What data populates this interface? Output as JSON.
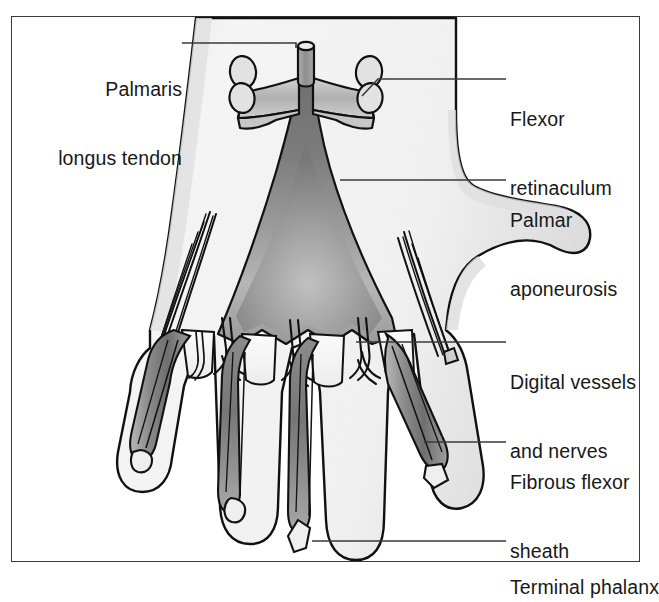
{
  "figure": {
    "frame_border_color": "#3a3a3a",
    "background_color": "#ffffff"
  },
  "palette": {
    "outline": "#111111",
    "leader_line": "#3a3a3a",
    "text": "#181818",
    "skin_light": "#f2f2f2",
    "skin_shade": "#d8d8d8",
    "aponeurosis_mid": "#8a8a8a",
    "aponeurosis_dark": "#6f6f6f",
    "aponeurosis_light": "#b4b4b4",
    "tendon_gray": "#9a9a9a",
    "sheath_dark": "#7d7d7d",
    "phalanx_fill": "#ededed"
  },
  "labels": {
    "left": [
      {
        "id": "palmaris-longus-tendon",
        "lines": [
          "Palmaris",
          "longus tendon"
        ],
        "text": "Palmaris longus tendon"
      }
    ],
    "right": [
      {
        "id": "flexor-retinaculum",
        "lines": [
          "Flexor",
          "retinaculum"
        ],
        "text": "Flexor retinaculum"
      },
      {
        "id": "palmar-aponeurosis",
        "lines": [
          "Palmar",
          "aponeurosis"
        ],
        "text": "Palmar aponeurosis"
      },
      {
        "id": "digital-vessels-and-nerves",
        "lines": [
          "Digital vessels",
          "and nerves"
        ],
        "text": "Digital vessels and nerves"
      },
      {
        "id": "fibrous-flexor-sheath",
        "lines": [
          "Fibrous flexor",
          "sheath"
        ],
        "text": "Fibrous flexor sheath"
      },
      {
        "id": "terminal-phalanx",
        "lines": [
          "Terminal phalanx"
        ],
        "text": "Terminal phalanx"
      }
    ]
  },
  "label_text": {
    "palmaris_l1": "Palmaris",
    "palmaris_l2": "longus tendon",
    "flexor_ret_l1": "Flexor",
    "flexor_ret_l2": "retinaculum",
    "palmar_apo_l1": "Palmar",
    "palmar_apo_l2": "aponeurosis",
    "digital_l1": "Digital vessels",
    "digital_l2": "and nerves",
    "fibrous_l1": "Fibrous flexor",
    "fibrous_l2": "sheath",
    "terminal_l1": "Terminal phalanx"
  },
  "structures": [
    {
      "id": "hand-outline",
      "name": "hand-outline",
      "description": "Palm and four fingers with thumb at right"
    },
    {
      "id": "flexor-retinaculum",
      "name": "flexor-retinaculum-band",
      "description": "Transverse band with four cut round ends at wrist"
    },
    {
      "id": "palmaris-longus-tendon",
      "name": "palmaris-longus-tendon",
      "description": "Small cut cylinder at proximal midline"
    },
    {
      "id": "palmar-aponeurosis",
      "name": "palmar-aponeurosis-fan",
      "description": "Triangular fan widening distally into four digital slips"
    },
    {
      "id": "digital-slips",
      "name": "digital-slips",
      "description": "Four distal slips of aponeurosis"
    },
    {
      "id": "digital-vessels",
      "name": "digital-vessels-and-nerves",
      "description": "Branching neurovascular bundles between digital slips"
    },
    {
      "id": "lumbrical-fascicles",
      "name": "lumbrical-fascicles",
      "description": "Oblique fascicles at medial and lateral palm borders"
    },
    {
      "id": "fibrous-flexor-sheaths",
      "name": "fibrous-flexor-sheaths",
      "description": "Dark tapering sheaths along each finger"
    },
    {
      "id": "terminal-phalanges",
      "name": "terminal-phalanges",
      "description": "Small diamond shapes at each fingertip"
    }
  ]
}
